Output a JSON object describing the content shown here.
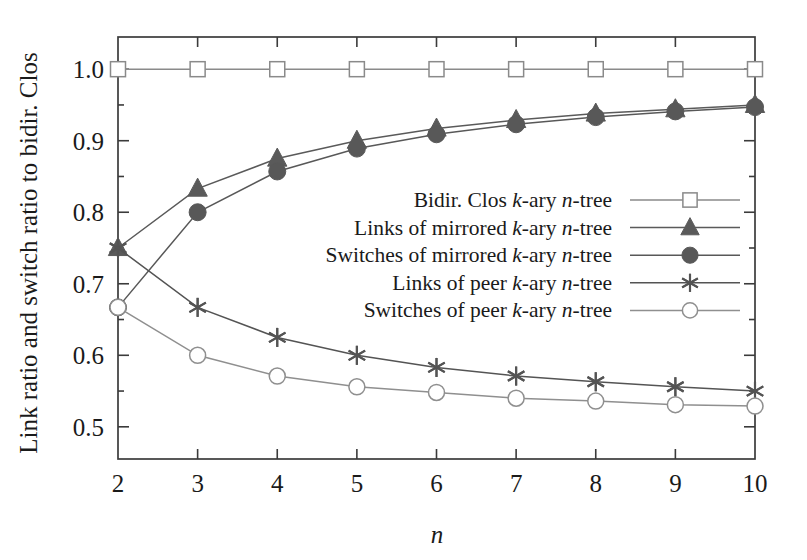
{
  "chart_data": {
    "type": "line",
    "title": "",
    "xlabel": "n",
    "ylabel": "Link ratio and switch ratio to bidir. Clos",
    "x": [
      2,
      3,
      4,
      5,
      6,
      7,
      8,
      9,
      10
    ],
    "xticklabels": [
      "2",
      "3",
      "4",
      "5",
      "6",
      "7",
      "8",
      "9",
      "10"
    ],
    "yticklabels": [
      "0.5",
      "0.6",
      "0.7",
      "0.8",
      "0.9",
      "1.0"
    ],
    "ytickvalues": [
      0.5,
      0.6,
      0.7,
      0.8,
      0.9,
      1.0
    ],
    "xlim": [
      2,
      10
    ],
    "ylim": [
      0.455,
      1.045
    ],
    "grid": false,
    "legend_position": "center-right",
    "series": [
      {
        "name": "Bidir. Clos k-ary n-tree",
        "label_parts": [
          "Bidir. Clos ",
          "k",
          "-ary ",
          "n",
          "-tree"
        ],
        "marker": "open-square",
        "color": "#8a8a8a",
        "values": [
          1.0,
          1.0,
          1.0,
          1.0,
          1.0,
          1.0,
          1.0,
          1.0,
          1.0
        ]
      },
      {
        "name": "Links of mirrored k-ary n-tree",
        "label_parts": [
          "Links of mirrored ",
          "k",
          "-ary ",
          "n",
          "-tree"
        ],
        "marker": "filled-triangle",
        "color": "#5a5a5a",
        "values": [
          0.75,
          0.833,
          0.875,
          0.9,
          0.917,
          0.929,
          0.938,
          0.944,
          0.95
        ]
      },
      {
        "name": "Switches of mirrored k-ary n-tree",
        "label_parts": [
          "Switches of mirrored ",
          "k",
          "-ary ",
          "n",
          "-tree"
        ],
        "marker": "filled-circle",
        "color": "#585858",
        "values": [
          0.667,
          0.8,
          0.857,
          0.889,
          0.909,
          0.923,
          0.933,
          0.941,
          0.947
        ]
      },
      {
        "name": "Links of peer k-ary n-tree",
        "label_parts": [
          "Links of peer ",
          "k",
          "-ary ",
          "n",
          "-tree"
        ],
        "marker": "asterisk",
        "color": "#545454",
        "values": [
          0.75,
          0.667,
          0.625,
          0.6,
          0.583,
          0.571,
          0.563,
          0.556,
          0.55
        ]
      },
      {
        "name": "Switches of peer k-ary n-tree",
        "label_parts": [
          "Switches of peer ",
          "k",
          "-ary ",
          "n",
          "-tree"
        ],
        "marker": "open-circle",
        "color": "#8f8f8f",
        "values": [
          0.667,
          0.6,
          0.571,
          0.556,
          0.548,
          0.54,
          0.536,
          0.531,
          0.529
        ]
      }
    ]
  },
  "axes": {
    "ylabel_text": "Link ratio and switch ratio to bidir. Clos",
    "xlabel_text": "n"
  }
}
